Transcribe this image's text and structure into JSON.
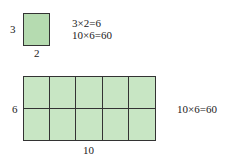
{
  "small_rect": {
    "height_label": "3",
    "width_label": "2",
    "fill": "#b5dbb0"
  },
  "equations": [
    "3×2=6",
    "10×6=60"
  ],
  "grid": {
    "rows": 2,
    "cols": 5,
    "height_label": "6",
    "width_label": "10",
    "fill": "#c8e6c4"
  },
  "grid_equation": "10×6=60"
}
